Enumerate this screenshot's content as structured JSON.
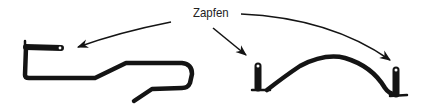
{
  "figure": {
    "label": "Zapfen",
    "parts": [
      {
        "name": "left-hook-bracket",
        "description": "bent wire hook with pin tab"
      },
      {
        "name": "right-arch-bracket",
        "description": "arched bracket with two pin posts"
      }
    ],
    "arrows": [
      {
        "name": "arrow-to-left-hook-pin",
        "target": "left hook tab"
      },
      {
        "name": "arrow-to-arch-left-pin",
        "target": "arch left post"
      },
      {
        "name": "arrow-to-arch-right-pin",
        "target": "arch right post"
      }
    ],
    "colors": {
      "ink": "#141414",
      "background": "#ffffff",
      "text": "#222222"
    }
  }
}
